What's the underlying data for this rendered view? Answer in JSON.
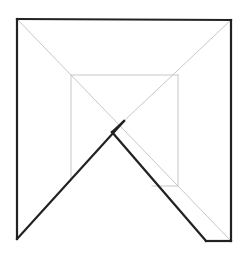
{
  "diagram": {
    "type": "geometric-line-drawing",
    "colors": {
      "background": "#ffffff",
      "thick_stroke": "#222222",
      "thin_stroke": "#c8c8c8"
    },
    "thick_segments": [
      {
        "name": "outer-left-edge",
        "x1": 17,
        "y1": 19,
        "x2": 17,
        "y2": 239
      },
      {
        "name": "outer-top-edge",
        "x1": 17,
        "y1": 19,
        "x2": 231,
        "y2": 20
      },
      {
        "name": "outer-right-edge",
        "x1": 231,
        "y1": 20,
        "x2": 231,
        "y2": 241
      },
      {
        "name": "bottom-right-foot",
        "x1": 206,
        "y1": 241,
        "x2": 231,
        "y2": 241
      },
      {
        "name": "left-rising-diagonal",
        "x1": 17,
        "y1": 239,
        "x2": 124,
        "y2": 121
      },
      {
        "name": "right-falling-diagonal",
        "x1": 112,
        "y1": 132,
        "x2": 206,
        "y2": 241
      },
      {
        "name": "fold-notch",
        "x1": 112,
        "y1": 132,
        "x2": 124,
        "y2": 121
      }
    ],
    "thin_segments": [
      {
        "name": "main-diagonal-tl-br",
        "x1": 17,
        "y1": 19,
        "x2": 231,
        "y2": 241
      },
      {
        "name": "main-diagonal-tr-center",
        "x1": 231,
        "y1": 20,
        "x2": 124,
        "y2": 121
      },
      {
        "name": "inner-square-top",
        "x1": 71,
        "y1": 75,
        "x2": 178,
        "y2": 75
      },
      {
        "name": "inner-square-left",
        "x1": 71,
        "y1": 75,
        "x2": 71,
        "y2": 180
      },
      {
        "name": "inner-square-right",
        "x1": 178,
        "y1": 75,
        "x2": 178,
        "y2": 186
      },
      {
        "name": "inner-square-bottom",
        "x1": 152,
        "y1": 186,
        "x2": 178,
        "y2": 186
      }
    ]
  }
}
